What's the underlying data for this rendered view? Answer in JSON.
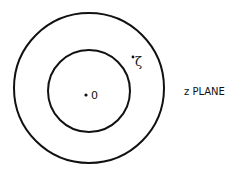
{
  "diagram": {
    "plane_label": "z PLANE",
    "origin_label": "0",
    "point_label": "ζ",
    "circles": [
      {
        "name": "outer",
        "cx": 89,
        "cy": 88,
        "r": 75
      },
      {
        "name": "inner",
        "cx": 89,
        "cy": 91,
        "r": 41
      }
    ],
    "points": [
      {
        "name": "origin",
        "x": 86,
        "y": 95
      },
      {
        "name": "zeta",
        "x": 133,
        "y": 57
      }
    ],
    "stroke_color": "#111111",
    "background": "#ffffff"
  }
}
